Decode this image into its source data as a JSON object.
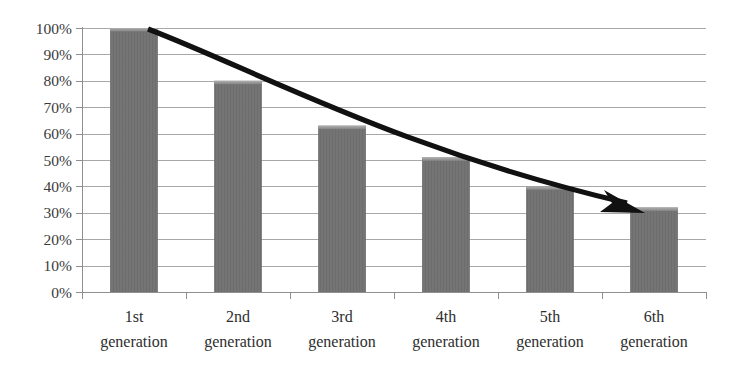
{
  "chart_data": {
    "type": "bar",
    "title": "",
    "subtitle": "",
    "xlabel": "",
    "ylabel": "",
    "categories": [
      "1st generation",
      "2nd generation",
      "3rd generation",
      "4th generation",
      "5th generation",
      "6th generation"
    ],
    "category_lines": [
      [
        "1st",
        "generation"
      ],
      [
        "2nd",
        "generation"
      ],
      [
        "3rd",
        "generation"
      ],
      [
        "4th",
        "generation"
      ],
      [
        "5th",
        "generation"
      ],
      [
        "6th",
        "generation"
      ]
    ],
    "values": [
      100,
      80,
      63,
      51,
      40,
      32
    ],
    "value_labels": [
      "100%",
      "80%",
      "63%",
      "51%",
      "40%",
      "32%"
    ],
    "ylim": [
      0,
      100
    ],
    "ytick_values": [
      0,
      10,
      20,
      30,
      40,
      50,
      60,
      70,
      80,
      90,
      100
    ],
    "ytick_labels": [
      "0%",
      "10%",
      "20%",
      "30%",
      "40%",
      "50%",
      "60%",
      "70%",
      "80%",
      "90%",
      "100%"
    ],
    "grid": true,
    "legend": false,
    "legend_position": "none",
    "annotations": [
      {
        "name": "declining-trend-arrow",
        "type": "arrow",
        "from_category": "1st generation",
        "to_category": "6th generation",
        "from_value": 100,
        "to_value": 32,
        "direction": "down-right",
        "label": ""
      }
    ],
    "colors": {
      "bar_fill": "#737373",
      "bar_fill_dark": "#6a6a6a",
      "bar_top_highlight": "#a3a3a3",
      "gridline": "#a8a8a8",
      "axis": "#8f8f8f",
      "arrow": "#111111",
      "background": "#ffffff",
      "tick_text": "#3b3b3b"
    }
  },
  "axes": {
    "y_axis_name": "percentage-axis",
    "x_axis_name": "generation-axis"
  }
}
